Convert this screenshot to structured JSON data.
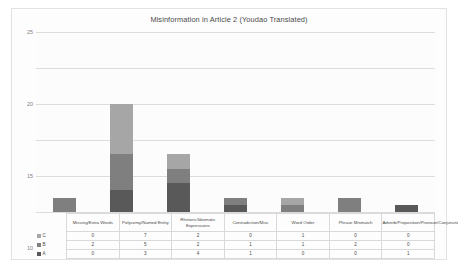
{
  "chart_data": {
    "type": "bar",
    "subtype": "stacked-column",
    "title": "Misinformation in Article 2 (Youdao Translated)",
    "xlabel": "",
    "ylabel": "",
    "ylim": [
      0,
      25
    ],
    "yticks": [
      0,
      5,
      10,
      15,
      20,
      25
    ],
    "grid": true,
    "legend_position": "table-left",
    "categories": [
      "Missing/Extra Words",
      "Polysemy/Named Entity",
      "Rhetoric/Idiomatic Expressions",
      "Contradiction/Misc",
      "Word Order",
      "Phrase Mismatch",
      "Adverb/Preposition/Pronoun/Conjunction"
    ],
    "series": [
      {
        "name": "C",
        "color": "#a6a6a6",
        "values": [
          0,
          7,
          2,
          0,
          1,
          0,
          0
        ]
      },
      {
        "name": "B",
        "color": "#7f7f7f",
        "values": [
          2,
          5,
          2,
          1,
          1,
          2,
          0
        ]
      },
      {
        "name": "A",
        "color": "#595959",
        "values": [
          0,
          3,
          4,
          1,
          0,
          0,
          1
        ]
      }
    ],
    "totals": [
      2,
      15,
      8,
      2,
      2,
      2,
      1
    ]
  },
  "table": {
    "row_order": [
      "C",
      "B",
      "A"
    ]
  }
}
